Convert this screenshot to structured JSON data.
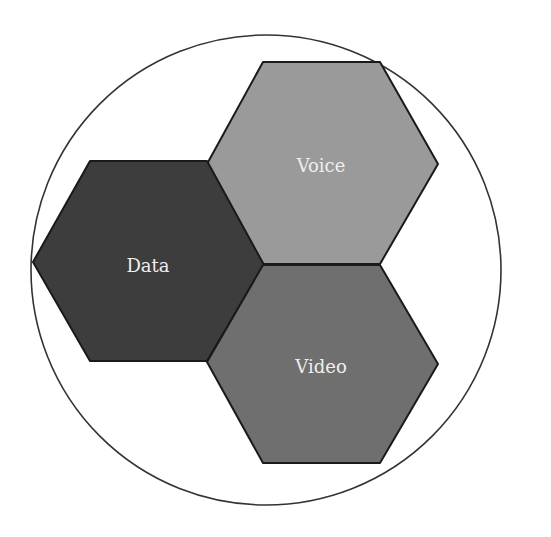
{
  "diagram": {
    "type": "hexagon-cluster-in-circle",
    "circle": {
      "cx": 266,
      "cy": 270,
      "r": 235,
      "stroke": "#333333"
    },
    "hexagons": [
      {
        "id": "voice",
        "label": "Voice",
        "fill": "#9a9a9a",
        "points": "263,62 380,62 438,164 380,264 263,264 207,164",
        "label_x": 321,
        "label_y": 172
      },
      {
        "id": "data",
        "label": "Data",
        "fill": "#3d3d3d",
        "points": "90,161 207,161 264,265 207,361 90,361 33,262",
        "label_x": 148,
        "label_y": 272
      },
      {
        "id": "video",
        "label": "Video",
        "fill": "#6f6f6f",
        "points": "263,265 380,265 438,364 380,463 263,463 207,362",
        "label_x": 321,
        "label_y": 373
      }
    ]
  }
}
